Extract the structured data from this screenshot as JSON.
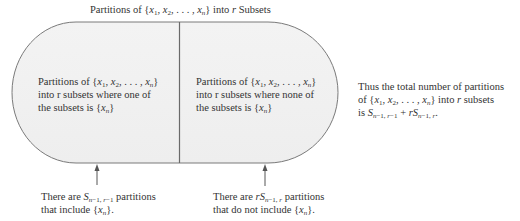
{
  "title": {
    "prefix": "Partitions of {",
    "set": "x1, x2, . . . , xn",
    "suffix": "} into r Subsets"
  },
  "left_region": {
    "lines": [
      "Partitions of {x1, x2, . . . , xn}",
      "into r subsets where one of",
      "the subsets is {xn}"
    ]
  },
  "right_region": {
    "lines": [
      "Partitions of {x1, x2, . . . , xn}",
      "into r subsets where none of",
      "the subsets is {xn}"
    ]
  },
  "summary": {
    "lines": [
      "Thus the total number of partitions",
      "of {x1, x2, . . . , xn} into r subsets",
      "is S(n−1, r−1) + rS(n−1, r)."
    ]
  },
  "left_caption": {
    "lines": [
      "There are S(n−1, r−1) partitions",
      "that include {xn}."
    ]
  },
  "right_caption": {
    "lines": [
      "There are rS(n−1, r) partitions",
      "that do not include {xn}."
    ]
  },
  "colors": {
    "fill": "#f1f1f1",
    "stroke": "#7a7a7a",
    "text": "#333333"
  }
}
